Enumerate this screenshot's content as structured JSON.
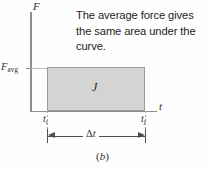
{
  "figure": {
    "panel_letter": "b",
    "panel_letter_open": "(",
    "panel_letter_close": ")",
    "caption": "The average force gives the same area under the curve."
  },
  "axes": {
    "y_label": "F",
    "x_label": "t",
    "y_tick_symbol": "F",
    "y_tick_subscript": "avg"
  },
  "annotations": {
    "impulse_symbol": "J",
    "t_initial_symbol": "t",
    "t_initial_subscript": "i",
    "t_final_symbol": "t",
    "t_final_subscript": "f",
    "delta_symbol": "Δ",
    "delta_variable": "t"
  },
  "chart_data": {
    "type": "area",
    "title": "",
    "subtitle": "The average force gives the same area under the curve.",
    "xlabel": "t",
    "ylabel": "F",
    "grid": false,
    "legend": null,
    "xlim": [
      0,
      1.28
    ],
    "ylim": [
      0,
      1.0
    ],
    "x_tick_labels": [
      "t_i",
      "t_f"
    ],
    "x_tick_values": [
      0.17,
      1.16
    ],
    "y_tick_labels": [
      "F_avg"
    ],
    "y_tick_values": [
      0.435
    ],
    "series": [
      {
        "name": "Average force rectangle (impulse J)",
        "shape": "rectangle",
        "x": [
          0.17,
          1.16
        ],
        "y": [
          0.435,
          0.435
        ],
        "fill": "#d4d4d4",
        "stroke": "#9a9a9a",
        "area_label": "J"
      }
    ],
    "annotations": [
      {
        "text": "J",
        "x": 0.665,
        "y": 0.22,
        "kind": "area-label"
      },
      {
        "text": "Δt",
        "x": 0.665,
        "y": -0.25,
        "kind": "dimension-line"
      },
      {
        "text": "The average force gives the same area under the curve.",
        "x": 0.62,
        "y": 1.05,
        "kind": "caption"
      }
    ]
  },
  "colors": {
    "background": "#fefefe",
    "axis": "#8e8e8e",
    "area_fill": "#d4d4d4",
    "area_stroke": "#9a9a9a",
    "text": "#2d2d2d",
    "dimension_line": "#4f4f4f",
    "leader_line": "#c0c0c0"
  }
}
